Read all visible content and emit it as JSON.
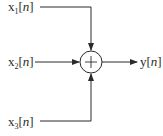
{
  "diagram": {
    "type": "signal-flow",
    "inputs": [
      {
        "id": "x1",
        "name": "x",
        "subscript": "1",
        "open": "[",
        "index": "n",
        "close": "]"
      },
      {
        "id": "x2",
        "name": "x",
        "subscript": "2",
        "open": "[",
        "index": "n",
        "close": "]"
      },
      {
        "id": "x3",
        "name": "x",
        "subscript": "3",
        "open": "[",
        "index": "n",
        "close": "]"
      }
    ],
    "output": {
      "id": "y",
      "name": "y",
      "open": "[",
      "index": "n",
      "close": "]"
    },
    "junction": {
      "symbol": "+",
      "type": "adder"
    },
    "colors": {
      "stroke": "#2a2a2a",
      "background": "#ffffff"
    }
  }
}
